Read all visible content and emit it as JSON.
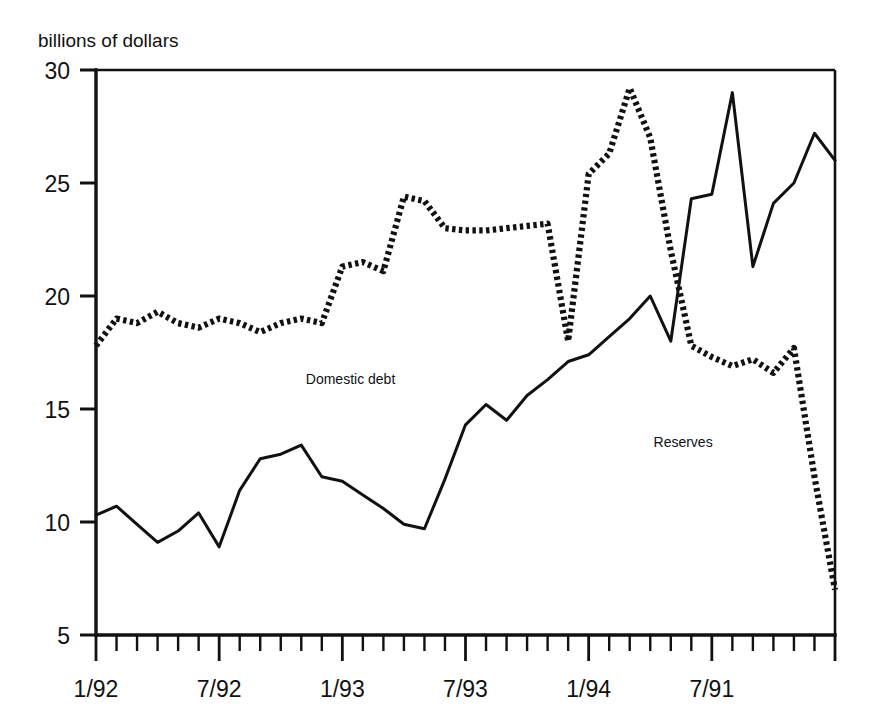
{
  "chart_data": {
    "type": "line",
    "title": "billions of dollars",
    "xlabel": "",
    "ylabel": "billions of dollars",
    "ylim": [
      5,
      30
    ],
    "yticks": [
      5,
      10,
      15,
      20,
      25,
      30
    ],
    "ytick_labels": [
      "5",
      "10",
      "15",
      "20",
      "25",
      "30"
    ],
    "xtick_labels": [
      "1/92",
      "7/92",
      "1/93",
      "7/93",
      "1/94",
      "7/91"
    ],
    "xtick_positions": [
      0,
      6,
      12,
      18,
      24,
      30
    ],
    "x_count": 36,
    "grid": false,
    "legend": "inline-annotations",
    "annotations": [
      {
        "text": "Domestic debt",
        "x_index": 12.4,
        "y_value": 16.1
      },
      {
        "text": "Reserves",
        "x_index": 28.6,
        "y_value": 13.3
      }
    ],
    "series": [
      {
        "name": "Domestic debt",
        "style": "solid",
        "values": [
          10.3,
          10.7,
          9.9,
          9.1,
          9.6,
          10.4,
          8.9,
          11.4,
          12.8,
          13.0,
          13.4,
          12.0,
          11.8,
          11.2,
          10.6,
          9.9,
          9.7,
          11.9,
          14.3,
          15.2,
          14.5,
          15.6,
          16.3,
          17.1,
          17.4,
          18.2,
          19.0,
          20.0,
          18.0,
          24.3,
          24.5,
          29.0,
          21.3,
          24.1,
          25.0,
          27.2,
          26.0
        ]
      },
      {
        "name": "Reserves",
        "style": "dotted",
        "values": [
          17.8,
          19.0,
          18.8,
          19.3,
          18.8,
          18.6,
          19.0,
          18.8,
          18.4,
          18.8,
          19.0,
          18.8,
          21.3,
          21.5,
          21.1,
          24.4,
          24.2,
          23.0,
          22.9,
          22.9,
          23.0,
          23.1,
          23.2,
          18.0,
          25.4,
          26.3,
          29.2,
          27.0,
          22.0,
          17.8,
          17.3,
          16.9,
          17.2,
          16.6,
          17.7,
          12.0,
          7.0
        ]
      }
    ]
  }
}
